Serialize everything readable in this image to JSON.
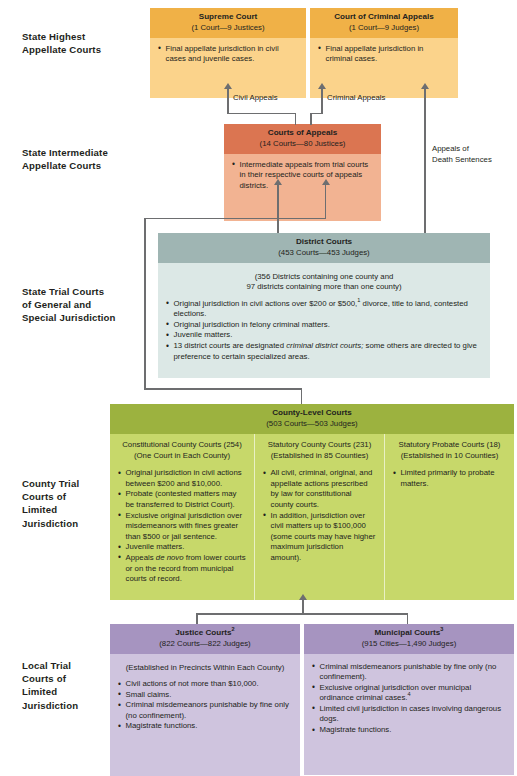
{
  "diagram": {
    "colors": {
      "highest_header": "#f0b147",
      "highest_body": "#fbd38b",
      "intermediate_header": "#db7551",
      "intermediate_body": "#f2b392",
      "district_header": "#9fb5b3",
      "district_body": "#dce8e6",
      "county_header": "#9cb23f",
      "county_body": "#c7d86a",
      "local_header": "#a694c0",
      "local_body": "#cfc4de",
      "connector": "#6d6e70",
      "text": "#231f20"
    }
  },
  "tiers": {
    "highest": "State Highest\nAppellate Courts",
    "highest_l1": "State Highest",
    "highest_l2": "Appellate Courts",
    "intermediate_l1": "State Intermediate",
    "intermediate_l2": "Appellate Courts",
    "trial_l1": "State Trial Courts",
    "trial_l2": "of General and",
    "trial_l3": "Special Jurisdiction",
    "county_l1": "County Trial",
    "county_l2": "Courts of",
    "county_l3": "Limited",
    "county_l4": "Jurisdiction",
    "local_l1": "Local Trial",
    "local_l2": "Courts of",
    "local_l3": "Limited",
    "local_l4": "Jurisdiction"
  },
  "supreme_court": {
    "title": "Supreme Court",
    "subtitle": "(1 Court—9 Justices)",
    "bullets": [
      "Final appellate jurisdiction in civil cases and juvenile cases."
    ]
  },
  "court_criminal_appeals": {
    "title": "Court of Criminal Appeals",
    "subtitle": "(1 Court—9 Judges)",
    "bullets": [
      "Final appellate jurisdiction in criminal cases."
    ]
  },
  "courts_of_appeals": {
    "title": "Courts of Appeals",
    "subtitle": "(14 Courts—80 Justices)",
    "bullets": [
      "Intermediate appeals from trial courts in their respective courts of appeals districts."
    ]
  },
  "district_courts": {
    "title": "District Courts",
    "subtitle": "(453 Courts—453 Judges)",
    "note_line1": "(356 Districts containing one county and",
    "note_line2": "97 districts containing more than one county)",
    "bullets": [
      {
        "pre": "Original jurisdiction in civil actions over $200 or $500,",
        "sup": "1",
        "post": " divorce, title to land, contested elections."
      },
      {
        "pre": "Original jurisdiction in felony criminal matters."
      },
      {
        "pre": "Juvenile matters."
      },
      {
        "pre": "13 district courts are designated ",
        "italic": "criminal district courts;",
        "post": " some others are directed to give preference to certain specialized areas."
      }
    ]
  },
  "county_level_courts": {
    "title": "County-Level Courts",
    "subtitle": "(503 Courts—503 Judges)",
    "columns": [
      {
        "title": "Constitutional County Courts (254)",
        "subtitle": "(One Court in Each County)",
        "bullets": [
          {
            "pre": "Original jurisdiction in civil actions between $200 and $10,000."
          },
          {
            "pre": "Probate (contested matters may be transferred to District Court)."
          },
          {
            "pre": "Exclusive original jurisdiction over misdemeanors with fines greater than $500 or jail sentence."
          },
          {
            "pre": "Juvenile matters."
          },
          {
            "pre": "Appeals ",
            "italic": "de novo",
            "post": " from lower courts or on the record from municipal courts of record."
          }
        ]
      },
      {
        "title": "Statutory County Courts (231)",
        "subtitle": "(Established in 85 Counties)",
        "bullets": [
          {
            "pre": "All civil, criminal, original, and appellate actions prescribed by law for constitutional county courts."
          },
          {
            "pre": "In addition, jurisdiction over civil matters up to $100,000 (some courts may have higher maximum jurisdiction amount)."
          }
        ]
      },
      {
        "title": "Statutory Probate Courts (18)",
        "subtitle": "(Established in 10 Counties)",
        "bullets": [
          {
            "pre": "Limited primarily to probate matters."
          }
        ]
      }
    ]
  },
  "justice_courts": {
    "title": "Justice Courts",
    "title_sup": "2",
    "subtitle": "(822 Courts—822 Judges)",
    "note": "(Established in Precincts Within Each County)",
    "bullets": [
      {
        "pre": "Civil actions of not more than $10,000."
      },
      {
        "pre": "Small claims."
      },
      {
        "pre": "Criminal misdemeanors punishable by fine only (no confinement)."
      },
      {
        "pre": "Magistrate functions."
      }
    ]
  },
  "municipal_courts": {
    "title": "Municipal Courts",
    "title_sup": "3",
    "subtitle": "(915 Cities—1,490 Judges)",
    "bullets": [
      {
        "pre": "Criminal misdemeanors punishable by fine only (no confinement)."
      },
      {
        "pre": "Exclusive original jurisdiction over municipal ordinance criminal cases.",
        "sup": "4"
      },
      {
        "pre": "Limited civil jurisdiction in cases involving dangerous dogs."
      },
      {
        "pre": "Magistrate functions."
      }
    ]
  },
  "connectors": {
    "civil_appeals": "Civil Appeals",
    "criminal_appeals": "Criminal Appeals",
    "death_sentences_l1": "Appeals of",
    "death_sentences_l2": "Death Sentences"
  }
}
